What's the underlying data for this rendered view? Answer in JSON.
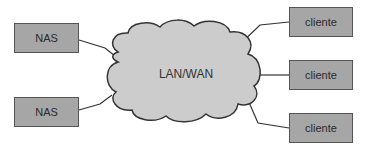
{
  "diagram": {
    "network": {
      "label": "LAN/WAN",
      "fill": "#cccccc",
      "stroke": "#333333"
    },
    "nas_nodes": [
      {
        "label": "NAS"
      },
      {
        "label": "NAS"
      }
    ],
    "client_nodes": [
      {
        "label": "cliente"
      },
      {
        "label": "cliente"
      },
      {
        "label": "cliente"
      }
    ],
    "node_fill": "#a6a6a6"
  }
}
